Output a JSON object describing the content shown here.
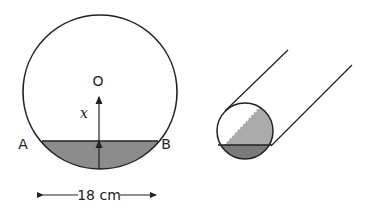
{
  "figure_left": {
    "center_label": "O",
    "distance_label": "x",
    "point_a": "A",
    "point_b": "B",
    "width_label": "18 cm",
    "segment_fill": "#8c8c8c"
  },
  "figure_right": {
    "description": "cylindrical pipe cross-section",
    "light_fill": "#ababab",
    "dark_fill": "#7a7a7a"
  }
}
